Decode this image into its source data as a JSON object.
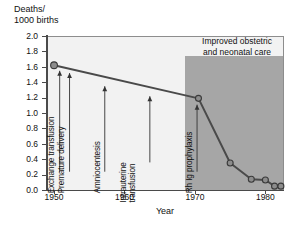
{
  "chart_data": {
    "type": "line",
    "title": "",
    "ylabel": "Deaths/\n1000 births",
    "xlabel": "Year",
    "xlim": [
      1949,
      1982.5
    ],
    "ylim": [
      0.0,
      2.0
    ],
    "grid": false,
    "legend_position": "none",
    "x": [
      1950,
      1970.5,
      1975,
      1978,
      1980,
      1981.3,
      1982.2
    ],
    "values": [
      1.62,
      1.19,
      0.35,
      0.14,
      0.13,
      0.05,
      0.05
    ],
    "series": [
      {
        "name": "Rh disease deaths per 1000 births",
        "x": [
          1950,
          1970.5,
          1975,
          1978,
          1980,
          1981.3,
          1982.2
        ],
        "values": [
          1.62,
          1.19,
          0.35,
          0.14,
          0.13,
          0.05,
          0.05
        ]
      }
    ],
    "ytick_labels": [
      "2.0",
      "1.8",
      "1.6",
      "1.4",
      "1.2",
      "1.0",
      "0.8",
      "0.6",
      "0.4",
      "0.2",
      "0.0"
    ],
    "ytick_values": [
      2.0,
      1.8,
      1.6,
      1.4,
      1.2,
      1.0,
      0.8,
      0.6,
      0.4,
      0.2,
      0.0
    ],
    "xtick_labels": [
      "1950",
      "1960",
      "1970",
      "1980"
    ],
    "xtick_values": [
      1950,
      1960,
      1970,
      1980
    ],
    "annotations": [
      {
        "label": "Exchange transfusion",
        "x": 1950.8,
        "y_tip": 1.6
      },
      {
        "label": "Premature delivery",
        "x": 1952.2,
        "y_tip": 1.57
      },
      {
        "label": "Amniocentesis",
        "x": 1957.2,
        "y_tip": 1.4
      },
      {
        "label": "Intrauterine\ntransfusion",
        "x": 1963.6,
        "y_tip": 1.27
      },
      {
        "label": "Rh Ig prophylaxis",
        "x": 1970.3,
        "y_tip": 1.16
      }
    ],
    "shaded_region": {
      "label": "Improved obstetric\nand neonatal care",
      "x_start": 1968.8,
      "x_end": 1982.5,
      "y_start": 0.0,
      "y_end": 1.75,
      "color": "#a6a6a6"
    },
    "colors": {
      "line": "#4a4a4a",
      "marker_fill": "#8c8c8c",
      "marker_edge": "#3a3a3a",
      "plot_background": "#f2f2f2",
      "shade": "#a6a6a6",
      "axis": "#4a4a4a",
      "text": "#111111"
    }
  }
}
